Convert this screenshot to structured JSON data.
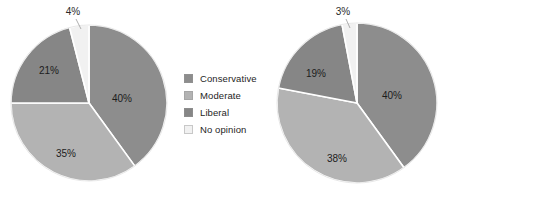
{
  "figure": {
    "background": "#ffffff",
    "width": 537,
    "height": 202
  },
  "palette": {
    "conservative": "#8d8d8d",
    "moderate": "#b3b3b3",
    "liberal": "#868686",
    "no_opinion": "#f1f1f1",
    "separator": "#ffffff",
    "label_text": "#1c1c1c",
    "legend_text": "#252525"
  },
  "legend": {
    "items": [
      {
        "label": "Conservative",
        "color": "#8d8d8d"
      },
      {
        "label": "Moderate",
        "color": "#b3b3b3"
      },
      {
        "label": "Liberal",
        "color": "#868686"
      },
      {
        "label": "No opinion",
        "color": "#f1f1f1"
      }
    ]
  },
  "chart_data": [
    {
      "type": "pie",
      "title": "",
      "categories": [
        "Conservative",
        "Moderate",
        "Liberal",
        "No opinion"
      ],
      "values": [
        40,
        35,
        21,
        4
      ],
      "labels": [
        "40%",
        "35%",
        "21%",
        "4%"
      ],
      "colors": [
        "#8d8d8d",
        "#b3b3b3",
        "#868686",
        "#f1f1f1"
      ],
      "start_angle_deg": 0,
      "direction": "clockwise",
      "legend_position": "right",
      "grid": false
    },
    {
      "type": "pie",
      "title": "",
      "categories": [
        "Conservative",
        "Moderate",
        "Liberal",
        "No opinion"
      ],
      "values": [
        40,
        38,
        19,
        3
      ],
      "labels": [
        "40%",
        "38%",
        "19%",
        "3%"
      ],
      "colors": [
        "#8d8d8d",
        "#b3b3b3",
        "#868686",
        "#f1f1f1"
      ],
      "start_angle_deg": 0,
      "direction": "clockwise",
      "legend_position": "right",
      "grid": false
    }
  ],
  "panels": [
    {
      "pie": {
        "cx": 89,
        "cy": 103,
        "r": 78
      },
      "legend_pos": {
        "left": 184,
        "top": 70
      },
      "slice_labels": [
        {
          "text": "40%",
          "x": 122,
          "y": 99,
          "outside": false
        },
        {
          "text": "35%",
          "x": 66,
          "y": 154,
          "outside": false
        },
        {
          "text": "21%",
          "x": 49,
          "y": 71,
          "outside": false
        },
        {
          "text": "4%",
          "x": 73,
          "y": 12,
          "outside": true,
          "leader": {
            "x1": 76,
            "y1": 19,
            "x2": 81,
            "y2": 29
          }
        }
      ]
    },
    {
      "pie": {
        "cx": 357,
        "cy": 103,
        "r": 80
      },
      "legend_pos": {
        "left": 452,
        "top": 70
      },
      "slice_labels": [
        {
          "text": "40%",
          "x": 392,
          "y": 96,
          "outside": false
        },
        {
          "text": "38%",
          "x": 337,
          "y": 159,
          "outside": false
        },
        {
          "text": "19%",
          "x": 316,
          "y": 74,
          "outside": false
        },
        {
          "text": "3%",
          "x": 343,
          "y": 12,
          "outside": true,
          "leader": {
            "x1": 346,
            "y1": 19,
            "x2": 350,
            "y2": 28
          }
        }
      ]
    }
  ]
}
